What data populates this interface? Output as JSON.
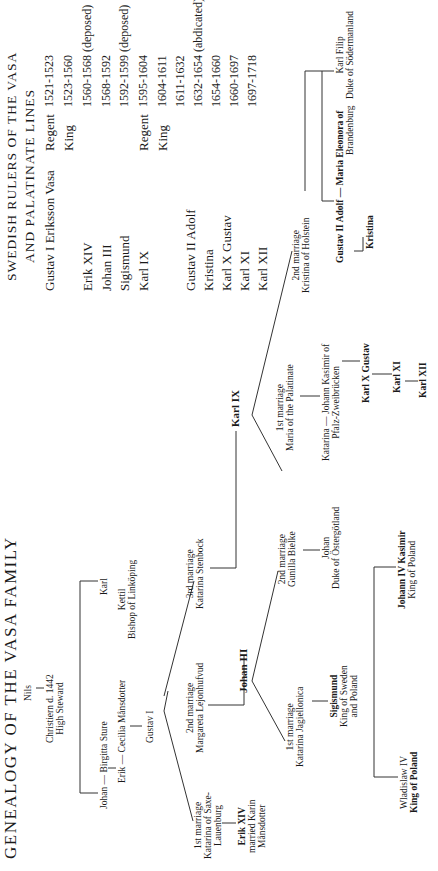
{
  "genealogy": {
    "title": "GENEALOGY OF THE VASA FAMILY",
    "nodes": {
      "nils": "Nils",
      "christiern": [
        "Christiern d. 1442",
        "High Steward"
      ],
      "johan_birgitta": "Johan — Birgitta  Sture",
      "karl": "Karl",
      "kettil": [
        "Kettil",
        "Bishop of Linköping"
      ],
      "erik_cecilia": "Erik — Cecilia  Månsdotter",
      "gustav_i": "Gustav I",
      "m1_gustav": [
        "1st marriage",
        "Katarina of Saxe-",
        "Lauenburg"
      ],
      "m2_gustav": [
        "2nd marriage",
        "Margareta Lejonhufvud"
      ],
      "m3_gustav": [
        "3rd marriage",
        "Katarina Stenbock"
      ],
      "erik_xiv": [
        "Erik XIV",
        "married Karin",
        "Månsdotter"
      ],
      "johan_iii": "Johan III",
      "karl_ix": "Karl IX",
      "m1_johan": [
        "1st marriage",
        "Katarina Jagiellonica"
      ],
      "m2_johan": [
        "2nd marriage",
        "Gunilla Bielke"
      ],
      "sigismund": [
        "Sigismund",
        "King of Sweden",
        "and Poland"
      ],
      "johan_duke": [
        "Johan",
        "Duke of Östergötland"
      ],
      "wladislaw": [
        "Wladislaw IV",
        "King of Poland"
      ],
      "johann_kasimir_poland": [
        "Johann IV Kasimir",
        "King of Poland"
      ],
      "m1_karl": [
        "1st marriage",
        "Maria of the Palatinate"
      ],
      "m2_karl": [
        "2nd marriage",
        "Kristina of Holstein"
      ],
      "katarina_johann": [
        "Katarina — Johann Kasimir of",
        "Pfalz-Zweibrücken"
      ],
      "karl_x": "Karl X Gustav",
      "karl_xi": "Karl XI",
      "karl_xii": "Karl XII",
      "gustav_ii": "Gustav II Adolf — Maria  Eleonora of",
      "brandenburg": "Brandenburg",
      "kristina": "Kristina",
      "karl_filip": [
        "Karl Filip",
        "Duke of Södermanland"
      ]
    }
  },
  "rulers": {
    "heading": [
      "SWEDISH RULERS OF THE VASA",
      "AND PALATINATE LINES"
    ],
    "rows": [
      {
        "name": "Gustav I Eriksson Vasa",
        "role": "Regent",
        "years": "1521-1523"
      },
      {
        "name": "",
        "role": "King",
        "years": "1523-1560"
      },
      {
        "name": "Erik XIV",
        "role": "",
        "years": "1560-1568 (deposed)"
      },
      {
        "name": "Johan III",
        "role": "",
        "years": "1568-1592"
      },
      {
        "name": "Sigismund",
        "role": "",
        "years": "1592-1599 (deposed)"
      },
      {
        "name": "Karl IX",
        "role": "Regent",
        "years": "1595-1604"
      },
      {
        "name": "",
        "role": "King",
        "years": "1604-1611"
      },
      {
        "name": "Gustav II Adolf",
        "role": "",
        "years": "1611-1632"
      },
      {
        "name": "Kristina",
        "role": "",
        "years": "1632-1654 (abdicated)"
      },
      {
        "name": "Karl X Gustav",
        "role": "",
        "years": "1654-1660"
      },
      {
        "name": "Karl XI",
        "role": "",
        "years": "1660-1697"
      },
      {
        "name": "Karl XII",
        "role": "",
        "years": "1697-1718"
      }
    ]
  }
}
